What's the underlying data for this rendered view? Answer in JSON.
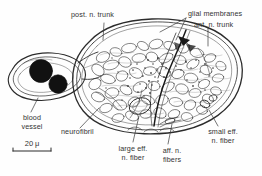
{
  "figure": {
    "background_color": "#fefefe",
    "ink_color": "#2b2b2b",
    "label_color": "#333333"
  },
  "labels": {
    "post_n_trunk": "post. n. trunk",
    "glial_membranes": "glial membranes",
    "ant_n_trunk": "ant. n. trunk",
    "blood_vessel_line1": "blood",
    "blood_vessel_line2": "vessel",
    "neurofibril": "neurofibril",
    "large_eff_line1": "large eff.",
    "large_eff_line2": "n. fiber",
    "aff_n_line1": "aff. n.",
    "aff_n_line2": "fibers",
    "small_eff_line1": "small eff.",
    "small_eff_line2": "n. fiber"
  },
  "scale_bar": {
    "value": "20",
    "unit": "μ"
  },
  "structures": {
    "nerve_cord": "large ovoid nerve cord filled with irregular cell profiles",
    "blood_vessel": "small oval vessel at left containing two dark blood cells",
    "blood_cells_count": 2
  }
}
